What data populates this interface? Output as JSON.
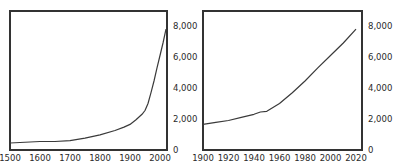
{
  "chart_data": [
    {
      "type": "line",
      "title": "",
      "xlabel": "",
      "ylabel": "",
      "x": [
        1500,
        1600,
        1650,
        1700,
        1750,
        1800,
        1850,
        1880,
        1900,
        1920,
        1940,
        1950,
        1960,
        1970,
        1980,
        1990,
        2000,
        2010,
        2020
      ],
      "series": [
        {
          "name": "World population (millions)",
          "values": [
            450,
            550,
            550,
            600,
            760,
            980,
            1260,
            1480,
            1650,
            1950,
            2300,
            2550,
            3000,
            3700,
            4450,
            5300,
            6100,
            6900,
            7800
          ]
        }
      ],
      "xlim": [
        1500,
        2020
      ],
      "ylim": [
        0,
        9000
      ],
      "x_ticks": [
        "1500",
        "1600",
        "1700",
        "1800",
        "1900",
        "2000"
      ],
      "y_ticks": [
        "0",
        "2,000",
        "4,000",
        "6,000",
        "8,000"
      ],
      "y_axis_position": "right",
      "grid": false,
      "legend": "none"
    },
    {
      "type": "line",
      "title": "",
      "xlabel": "",
      "ylabel": "",
      "x": [
        1900,
        1910,
        1920,
        1930,
        1940,
        1945,
        1950,
        1960,
        1970,
        1980,
        1990,
        2000,
        2010,
        2020
      ],
      "series": [
        {
          "name": "World population (millions)",
          "values": [
            1650,
            1780,
            1900,
            2100,
            2300,
            2450,
            2500,
            3000,
            3700,
            4450,
            5300,
            6100,
            6900,
            7800
          ]
        }
      ],
      "xlim": [
        1900,
        2025
      ],
      "ylim": [
        0,
        9000
      ],
      "x_ticks": [
        "1900",
        "1920",
        "1940",
        "1960",
        "1980",
        "2000",
        "2020"
      ],
      "y_ticks": [
        "0",
        "2,000",
        "4,000",
        "6,000",
        "8,000"
      ],
      "y_axis_position": "right",
      "grid": false,
      "legend": "none"
    }
  ],
  "colors": {
    "line": "#3a3a3a",
    "frame": "#333333",
    "text": "#2a2a2a",
    "background": "#ffffff"
  }
}
